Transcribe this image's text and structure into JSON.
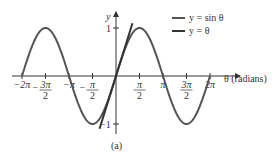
{
  "chart_data": {
    "type": "line",
    "title": "",
    "caption": "(a)",
    "xlabel": "θ (radians)",
    "ylabel": "y",
    "xlim": [
      -6.2832,
      6.2832
    ],
    "ylim": [
      -1,
      1
    ],
    "grid": false,
    "legend_position": "top-right",
    "x_ticks": [
      {
        "value": -6.2832,
        "label": "−2π"
      },
      {
        "value": -4.7124,
        "label": "−3π/2"
      },
      {
        "value": -3.1416,
        "label": "−π"
      },
      {
        "value": -1.5708,
        "label": "−π/2"
      },
      {
        "value": 1.5708,
        "label": "π/2"
      },
      {
        "value": 3.1416,
        "label": "π"
      },
      {
        "value": 4.7124,
        "label": "3π/2"
      },
      {
        "value": 6.2832,
        "label": "2π"
      }
    ],
    "y_ticks": [
      {
        "value": 1,
        "label": "1"
      },
      {
        "value": -1,
        "label": "−1"
      }
    ],
    "series": [
      {
        "name": "y = sin θ",
        "function": "sin",
        "domain": [
          -6.2832,
          6.2832
        ],
        "color": "#555555"
      },
      {
        "name": "y = θ",
        "function": "identity",
        "domain": [
          -1.1,
          1.1
        ],
        "color": "#333333"
      }
    ]
  },
  "legend": {
    "items": [
      {
        "label": "y = sin θ"
      },
      {
        "label": "y = θ"
      }
    ]
  },
  "axes": {
    "x_label": "θ (radians)",
    "y_label": "y",
    "y_tick_pos": "1",
    "y_tick_neg": "−1"
  },
  "caption": "(a)"
}
